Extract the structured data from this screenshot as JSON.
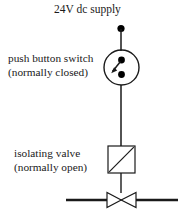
{
  "diagram": {
    "supply": {
      "label": "24V dc supply"
    },
    "switch": {
      "label_line1": "push button switch",
      "label_line2": "(normally closed)",
      "symbol": "push-button-switch-normally-closed"
    },
    "valve": {
      "label_line1": "isolating valve",
      "label_line2": "(normally open)",
      "symbol": "isolating-valve-normally-open"
    },
    "colors": {
      "line": "#1a1a1a",
      "text": "#1a1a1a",
      "background": "#ffffff",
      "terminal_dot": "#000000"
    }
  }
}
